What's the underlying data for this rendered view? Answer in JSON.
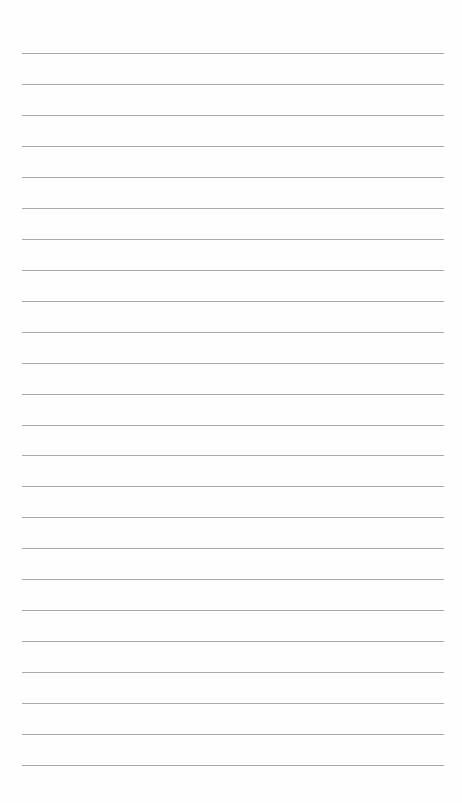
{
  "page": {
    "type": "lined-paper",
    "line_count": 24,
    "first_line_y": 53,
    "line_spacing": 30.96,
    "line_left": 22,
    "line_width": 422,
    "line_color": "#a9a9a9",
    "background": "#fefefe"
  }
}
